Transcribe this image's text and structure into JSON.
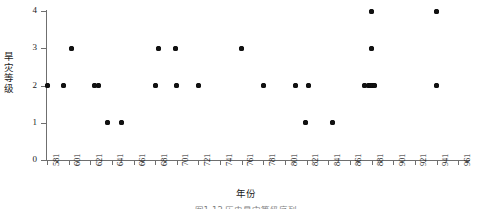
{
  "chart_data": {
    "type": "scatter",
    "title": "",
    "xlabel": "年份",
    "ylabel": "旱灾等级",
    "xlim": [
      581,
      971
    ],
    "ylim": [
      0,
      4
    ],
    "grid": false,
    "legend": null,
    "x_tick_labels": [
      "581",
      "601",
      "621",
      "641",
      "661",
      "681",
      "701",
      "721",
      "741",
      "761",
      "781",
      "801",
      "821",
      "841",
      "861",
      "881",
      "901",
      "921",
      "941",
      "961"
    ],
    "y_tick_labels": [
      "0",
      "1",
      "2",
      "3",
      "4"
    ],
    "x_ticks": [
      581,
      601,
      621,
      641,
      661,
      681,
      701,
      721,
      741,
      761,
      781,
      801,
      821,
      841,
      861,
      881,
      901,
      921,
      941,
      961
    ],
    "y_ticks": [
      0,
      1,
      2,
      3,
      4
    ],
    "points": [
      {
        "x": 581,
        "y": 2
      },
      {
        "x": 596,
        "y": 2
      },
      {
        "x": 604,
        "y": 3
      },
      {
        "x": 625,
        "y": 2
      },
      {
        "x": 629,
        "y": 2
      },
      {
        "x": 637,
        "y": 1
      },
      {
        "x": 650,
        "y": 1
      },
      {
        "x": 681,
        "y": 2
      },
      {
        "x": 684,
        "y": 3
      },
      {
        "x": 700,
        "y": 3
      },
      {
        "x": 701,
        "y": 2
      },
      {
        "x": 721,
        "y": 2
      },
      {
        "x": 761,
        "y": 3
      },
      {
        "x": 781,
        "y": 2
      },
      {
        "x": 811,
        "y": 2
      },
      {
        "x": 820,
        "y": 1
      },
      {
        "x": 823,
        "y": 2
      },
      {
        "x": 845,
        "y": 1
      },
      {
        "x": 874,
        "y": 2
      },
      {
        "x": 878,
        "y": 2
      },
      {
        "x": 880,
        "y": 2
      },
      {
        "x": 882,
        "y": 2
      },
      {
        "x": 884,
        "y": 2
      },
      {
        "x": 881,
        "y": 3
      },
      {
        "x": 881,
        "y": 4
      },
      {
        "x": 941,
        "y": 4
      },
      {
        "x": 941,
        "y": 2
      }
    ]
  },
  "caption": {
    "text": "图1-12  历史旱灾等级序列"
  }
}
